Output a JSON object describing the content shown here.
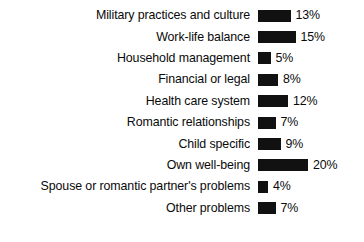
{
  "chart_data": {
    "type": "bar",
    "title": "",
    "subtitle": "",
    "xlabel": "",
    "ylabel": "",
    "orientation": "horizontal",
    "grid": false,
    "legend": false,
    "axis_visible": false,
    "value_suffix": "%",
    "xlim": [
      0,
      20
    ],
    "bar_color": "#111111",
    "background_color": "#ffffff",
    "categories": [
      "Military practices and culture",
      "Work-life balance",
      "Household management",
      "Financial or legal",
      "Health care system",
      "Romantic relationships",
      "Child specific",
      "Own well-being",
      "Spouse or romantic partner's problems",
      "Other problems"
    ],
    "values": [
      13,
      15,
      5,
      8,
      12,
      7,
      9,
      20,
      4,
      7
    ],
    "value_labels": [
      "13%",
      "15%",
      "5%",
      "8%",
      "12%",
      "7%",
      "9%",
      "20%",
      "4%",
      "7%"
    ]
  }
}
